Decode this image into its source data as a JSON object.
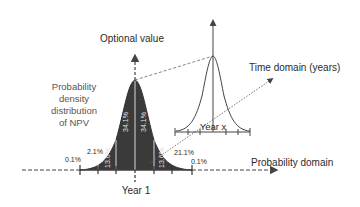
{
  "labels": {
    "optional_value": "Optional value",
    "time_domain": "Time domain (years)",
    "density_line1": "Probability",
    "density_line2": "density",
    "density_line3": "distribution",
    "density_line4": "of NPV",
    "year_1": "Year 1",
    "year_x": "Year x",
    "probability_domain": "Probability domain"
  },
  "percentages": {
    "left_tail": "0.1%",
    "left_outer": "2.1%",
    "left_mid": "13.6%",
    "left_center": "34.1%",
    "right_center": "34.1%",
    "right_mid": "13.6%",
    "right_outer": "21.1%",
    "right_tail": "0.1%"
  },
  "colors": {
    "fill": "#3a3a3a",
    "stroke": "#444444",
    "text": "#2b2b2b",
    "inner_text": "#e0e0e0"
  }
}
